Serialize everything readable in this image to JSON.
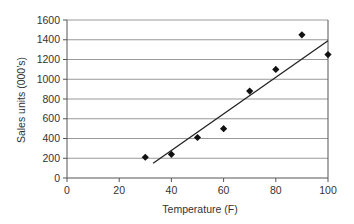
{
  "chart_data": {
    "type": "scatter",
    "title": "",
    "xlabel": "Temperature (F)",
    "ylabel": "Sales units (000’s)",
    "xlim": [
      0,
      100
    ],
    "ylim": [
      0,
      1600
    ],
    "x_ticks": [
      0,
      20,
      40,
      60,
      80,
      100
    ],
    "y_ticks": [
      0,
      200,
      400,
      600,
      800,
      1000,
      1200,
      1400,
      1600
    ],
    "grid": {
      "horizontal": true,
      "vertical": false
    },
    "legend": null,
    "series": [
      {
        "name": "Sales",
        "marker": "diamond",
        "points": [
          {
            "x": 30,
            "y": 210
          },
          {
            "x": 40,
            "y": 240
          },
          {
            "x": 50,
            "y": 410
          },
          {
            "x": 60,
            "y": 500
          },
          {
            "x": 70,
            "y": 880
          },
          {
            "x": 80,
            "y": 1100
          },
          {
            "x": 90,
            "y": 1450
          },
          {
            "x": 100,
            "y": 1250
          }
        ]
      }
    ],
    "trendline": {
      "type": "linear",
      "start": {
        "x": 33,
        "y": 150
      },
      "end": {
        "x": 100,
        "y": 1390
      }
    }
  },
  "colors": {
    "marker": "#111111",
    "trendline": "#222222",
    "grid": "#999999",
    "axis": "#555555",
    "text": "#333333"
  }
}
